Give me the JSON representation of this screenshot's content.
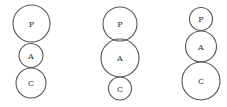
{
  "diagram": {
    "figures": [
      {
        "circles": [
          {
            "label": "P",
            "cx": 31.5,
            "cy": 23.5,
            "r": 18.5
          },
          {
            "label": "A",
            "cx": 31,
            "cy": 55.5,
            "r": 12
          },
          {
            "label": "C",
            "cx": 31,
            "cy": 83,
            "r": 15
          }
        ]
      },
      {
        "circles": [
          {
            "label": "P",
            "cx": 120,
            "cy": 24,
            "r": 17
          },
          {
            "label": "A",
            "cx": 120,
            "cy": 58,
            "r": 19
          },
          {
            "label": "C",
            "cx": 120,
            "cy": 88.5,
            "r": 11.5
          }
        ]
      },
      {
        "circles": [
          {
            "label": "P",
            "cx": 201,
            "cy": 19,
            "r": 11.5
          },
          {
            "label": "A",
            "cx": 201,
            "cy": 46.5,
            "r": 15.5
          },
          {
            "label": "C",
            "cx": 201,
            "cy": 81,
            "r": 19
          }
        ]
      }
    ]
  }
}
